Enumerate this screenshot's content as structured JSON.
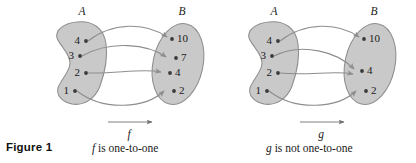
{
  "figure": {
    "number_label": "Figure 1",
    "colors": {
      "set_fill": "#c9c9c9",
      "set_stroke": "#8d8d8d",
      "curve": "#8d8d8d",
      "dot": "#3a3a3a",
      "text": "#1a1a1a",
      "background": "#ffffff"
    }
  },
  "diagrams": [
    {
      "id": "left",
      "function_name": "f",
      "caption_function": "f",
      "caption_rest": " is one-to-one",
      "domain": {
        "label": "A",
        "elements": [
          "4",
          "3",
          "2",
          "1"
        ]
      },
      "codomain": {
        "label": "B",
        "elements": [
          "10",
          "7",
          "4",
          "2"
        ]
      },
      "mappings": [
        {
          "from": "4",
          "to": "10"
        },
        {
          "from": "3",
          "to": "7"
        },
        {
          "from": "2",
          "to": "4"
        },
        {
          "from": "1",
          "to": "2"
        }
      ]
    },
    {
      "id": "right",
      "function_name": "g",
      "caption_function": "g",
      "caption_rest": " is not one-to-one",
      "domain": {
        "label": "A",
        "elements": [
          "4",
          "3",
          "2",
          "1"
        ]
      },
      "codomain": {
        "label": "B",
        "elements": [
          "10",
          "4",
          "2"
        ]
      },
      "mappings": [
        {
          "from": "4",
          "to": "10"
        },
        {
          "from": "3",
          "to": "4"
        },
        {
          "from": "2",
          "to": "4"
        },
        {
          "from": "1",
          "to": "2"
        }
      ]
    }
  ]
}
